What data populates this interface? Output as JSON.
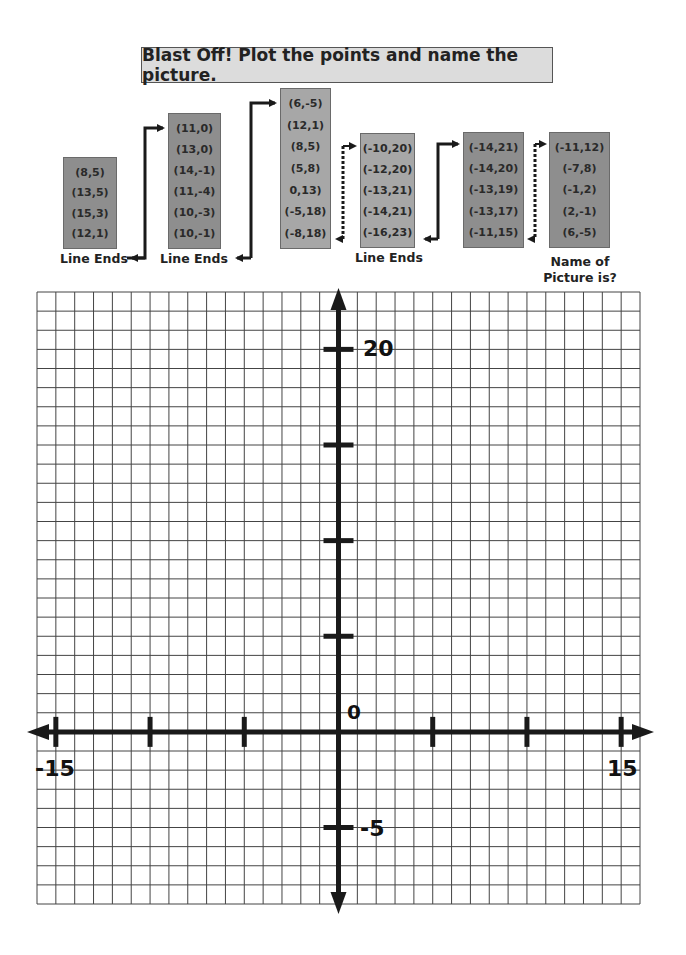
{
  "title": "Blast Off! Plot the points and name the picture.",
  "boxes": [
    {
      "points": [
        "(8,5)",
        "(13,5)",
        "(15,3)",
        "(12,1)"
      ],
      "shade": "dark"
    },
    {
      "points": [
        "(11,0)",
        "(13,0)",
        "(14,-1)",
        "(11,-4)",
        "(10,-3)",
        "(10,-1)"
      ],
      "shade": "dark"
    },
    {
      "points": [
        "(6,-5)",
        "(12,1)",
        "(8,5)",
        "(5,8)",
        "0,13)",
        "(-5,18)",
        "(-8,18)"
      ],
      "shade": "light"
    },
    {
      "points": [
        "(-10,20)",
        "(-12,20)",
        "(-13,21)",
        "(-14,21)",
        "(-16,23)"
      ],
      "shade": "light"
    },
    {
      "points": [
        "(-14,21)",
        "(-14,20)",
        "(-13,19)",
        "(-13,17)",
        "(-11,15)"
      ],
      "shade": "dark"
    },
    {
      "points": [
        "(-11,12)",
        "(-7,8)",
        "(-1,2)",
        "(2,-1)",
        "(6,-5)"
      ],
      "shade": "dark"
    }
  ],
  "captions": {
    "line_ends_1": "Line Ends",
    "line_ends_2": "Line Ends",
    "line_ends_3": "Line Ends",
    "name_of_picture_line1": "Name of",
    "name_of_picture_line2": "Picture is?"
  },
  "grid": {
    "x_min": -16,
    "x_max": 16,
    "y_min": -9,
    "y_max": 23,
    "axis_labels": {
      "x_neg": "-15",
      "x_pos": "15",
      "y_pos": "20",
      "y_neg": "-5",
      "origin": "0"
    },
    "x_ticks": [
      -15,
      -10,
      -5,
      5,
      10,
      15
    ],
    "y_ticks": [
      20,
      15,
      10,
      5,
      -5
    ]
  },
  "colors": {
    "box_dark": "#8e8e8e",
    "box_light": "#a7a7a7",
    "title_bg": "#dcdcdc",
    "grid_line": "#444444",
    "axis": "#1a1a1a"
  }
}
